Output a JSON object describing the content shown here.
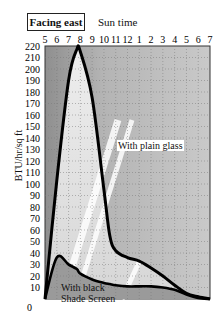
{
  "chart_data": {
    "type": "line",
    "title": "Facing east",
    "xlabel": "Sun time",
    "ylabel": "BTU/hr/sq ft",
    "x_ticks": [
      "5",
      "6",
      "7",
      "8",
      "9",
      "10",
      "11",
      "12",
      "1",
      "2",
      "3",
      "4",
      "5",
      "6",
      "7"
    ],
    "y_ticks": [
      0,
      10,
      20,
      30,
      40,
      50,
      60,
      70,
      80,
      90,
      100,
      110,
      120,
      130,
      140,
      150,
      160,
      170,
      180,
      190,
      200,
      210,
      220
    ],
    "ylim": [
      0,
      220
    ],
    "grid": true,
    "x": [
      0,
      1,
      2,
      2.7,
      3,
      4,
      5,
      5.5,
      6,
      7,
      8,
      9,
      10,
      11,
      12,
      13,
      14
    ],
    "series": [
      {
        "name": "With plain glass",
        "values": [
          0,
          103,
          190,
          217,
          215,
          175,
          95,
          55,
          42,
          36,
          33,
          27,
          20,
          12,
          5,
          2,
          0
        ]
      },
      {
        "name": "With black Shade Screen",
        "values": [
          0,
          36,
          30,
          26,
          22,
          17,
          14,
          13,
          12,
          11,
          11,
          11,
          10,
          8,
          4,
          1,
          0
        ]
      }
    ],
    "annotations": [
      "With plain glass",
      "With black\nShade Screen"
    ]
  },
  "labels": {
    "facing": "Facing east",
    "sun_time": "Sun time",
    "y_axis": "BTU/hr/sq ft",
    "plain_glass": "With plain glass",
    "shade_line1": "With black",
    "shade_line2": "Shade Screen"
  }
}
